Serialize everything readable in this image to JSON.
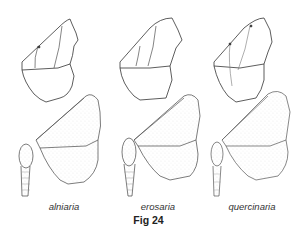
{
  "figure": {
    "caption": "Fig 24",
    "specimens": [
      {
        "name": "alniaria"
      },
      {
        "name": "erosaria"
      },
      {
        "name": "quercinaria"
      }
    ],
    "colors": {
      "line": "#333333",
      "stipple": "#9a9a9a"
    }
  }
}
